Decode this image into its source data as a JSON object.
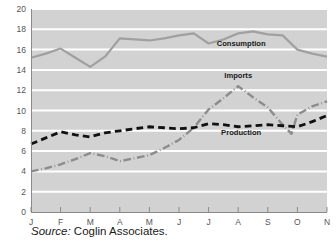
{
  "figure": {
    "source_prefix": "Source:",
    "source_text": "Coglin Associates."
  },
  "colors": {
    "plot_background": "#d2d2d2",
    "gridline": "#ffffff",
    "axis": "#8a8a8a",
    "consumption": "#a0a0a0",
    "imports": "#8c8c8c",
    "production": "#111111",
    "tick_label": "#555555",
    "series_label": "#1a1a1a"
  },
  "chart_data": {
    "type": "line",
    "title": "",
    "xlabel": "",
    "ylabel": "",
    "categories": [
      "J",
      "F",
      "M",
      "A",
      "M",
      "J",
      "J",
      "A",
      "S",
      "O",
      "N"
    ],
    "xtick_labels": [
      "J",
      "F",
      "M",
      "A",
      "M",
      "J",
      "J",
      "A",
      "S",
      "O",
      "N"
    ],
    "ytick_labels": [
      "0",
      "2",
      "4",
      "6",
      "8",
      "10",
      "12",
      "14",
      "16",
      "18",
      "20"
    ],
    "ytick_values": [
      0,
      2,
      4,
      6,
      8,
      10,
      12,
      14,
      16,
      18,
      20
    ],
    "ylim": [
      0,
      20
    ],
    "grid": true,
    "grid_axis": "y",
    "legend": "inline-annotations",
    "series": [
      {
        "name": "Consumption",
        "style": "solid",
        "color": "#a0a0a0",
        "label_x_index": 7.1,
        "label_y": 16.4,
        "x": [
          0,
          0.5,
          1,
          1.5,
          2,
          2.5,
          3,
          3.5,
          4,
          4.5,
          5,
          5.5,
          6,
          6.5,
          7,
          7.5,
          8,
          8.5,
          9,
          9.5,
          10
        ],
        "values": [
          15.2,
          15.6,
          16.1,
          15.2,
          14.3,
          15.3,
          17.1,
          17.0,
          16.9,
          17.1,
          17.4,
          17.6,
          16.6,
          17.0,
          17.6,
          17.8,
          17.5,
          17.4,
          16.0,
          15.6,
          15.3
        ]
      },
      {
        "name": "Imports",
        "style": "dashdot",
        "color": "#8c8c8c",
        "label_x_index": 7.0,
        "label_y": 13.2,
        "x": [
          0,
          0.5,
          1,
          1.5,
          2,
          2.5,
          3,
          3.5,
          4,
          4.5,
          5,
          5.5,
          6,
          6.5,
          7,
          7.5,
          8,
          8.5,
          8.8,
          9,
          9.5,
          10
        ],
        "values": [
          4.0,
          4.3,
          4.7,
          5.2,
          5.8,
          5.5,
          5.0,
          5.3,
          5.6,
          6.3,
          7.1,
          8.3,
          10.1,
          11.2,
          12.4,
          11.3,
          10.3,
          8.6,
          7.7,
          9.6,
          10.4,
          10.9
        ]
      },
      {
        "name": "Production",
        "style": "dashed",
        "color": "#111111",
        "label_x_index": 7.1,
        "label_y": 7.6,
        "x": [
          0,
          0.5,
          1,
          1.5,
          2,
          2.5,
          3,
          3.5,
          4,
          4.5,
          5,
          5.5,
          6,
          6.5,
          7,
          7.5,
          8,
          8.5,
          9,
          9.5,
          10
        ],
        "values": [
          6.7,
          7.3,
          7.9,
          7.6,
          7.4,
          7.8,
          8.0,
          8.2,
          8.4,
          8.3,
          8.2,
          8.3,
          8.7,
          8.6,
          8.4,
          8.5,
          8.6,
          8.5,
          8.4,
          8.9,
          9.5
        ]
      }
    ]
  }
}
